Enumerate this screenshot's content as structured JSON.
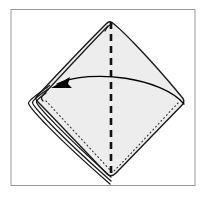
{
  "figure": {
    "title": "Napkin fold step diagram",
    "background_color": "#ffffff",
    "frame": {
      "name": "diagram-frame",
      "stroke_color": "#9a9a9a",
      "stroke_width": 1,
      "x": 11,
      "y": 9.5,
      "width": 184,
      "height": 176
    },
    "shape": {
      "name": "napkin-diamond",
      "fill_color": "#ededed",
      "stroke_color": "#1a1a1a",
      "stroke_width": 1.4,
      "top_vertex": [
        111,
        22
      ],
      "right_vertex": [
        185,
        101
      ],
      "bottom_vertex": [
        111,
        178
      ],
      "left_vertex": [
        31,
        101
      ]
    },
    "fold_line": {
      "name": "center-fold-dashed-line",
      "style": "dashed",
      "color": "#111111",
      "stroke_width": 2.6,
      "dash_pattern": "7 5",
      "from": [
        111,
        22
      ],
      "to": [
        111,
        178
      ]
    },
    "dotted_edge": {
      "name": "hidden-edge-dotted-line",
      "style": "dotted",
      "color": "#333333",
      "stroke_width": 1.1,
      "dash_pattern": "1 3"
    },
    "layer_lines": {
      "name": "folded-layer-edges",
      "count": 3,
      "color": "#1a1a1a",
      "spacing_px": 4
    },
    "arrow": {
      "name": "fold-direction-arrow",
      "color": "#000000",
      "stroke_width": 1.3,
      "direction": "right-to-left",
      "start": [
        184,
        104
      ],
      "control": [
        118,
        70
      ],
      "end": [
        56,
        86
      ],
      "head_length": 16,
      "head_width": 9
    }
  }
}
